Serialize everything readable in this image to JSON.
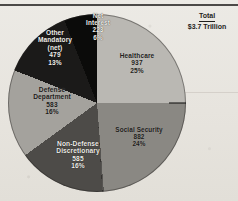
{
  "figure": {
    "total_label": "Total",
    "total_value": "$3.7 Trillion"
  },
  "chart_data": {
    "type": "pie",
    "title": "",
    "subtitle": "",
    "units": "billions of dollars",
    "total": "$3.7 Trillion",
    "legend_position": "none (labels inside slices)",
    "grid": false,
    "categories": [
      "Healthcare",
      "Social Security",
      "Non-Defense Discretionary",
      "Defense Department",
      "Other Mandatory (net)",
      "Net Interest"
    ],
    "values": [
      937,
      882,
      585,
      583,
      479,
      223
    ],
    "percentages": [
      25,
      24,
      16,
      16,
      13,
      6
    ],
    "slices": [
      {
        "name": "Healthcare",
        "label_lines": [
          "Healthcare",
          "937",
          "25%"
        ],
        "value": 937,
        "percent": "25%",
        "color": "#b9b7b2",
        "text_color": "dark"
      },
      {
        "name": "Social Security",
        "label_lines": [
          "Social Security",
          "882",
          "24%"
        ],
        "value": 882,
        "percent": "24%",
        "color": "#8a8883",
        "text_color": "dark"
      },
      {
        "name": "Non-Defense Discretionary",
        "label_lines": [
          "Non-Defense",
          "Discretionary",
          "585",
          "16%"
        ],
        "value": 585,
        "percent": "16%",
        "color": "#4e4c49",
        "text_color": "light"
      },
      {
        "name": "Defense Department",
        "label_lines": [
          "Defense",
          "Department",
          "583",
          "16%"
        ],
        "value": 583,
        "percent": "16%",
        "color": "#a3a19c",
        "text_color": "dark"
      },
      {
        "name": "Other Mandatory (net)",
        "label_lines": [
          "Other",
          "Mandatory",
          "(net)",
          "479",
          "13%"
        ],
        "value": 479,
        "percent": "13%",
        "color": "#1d1c1b",
        "text_color": "light"
      },
      {
        "name": "Net Interest",
        "label_lines": [
          "Net",
          "Interest",
          "223",
          "6%"
        ],
        "value": 223,
        "percent": "6%",
        "color": "#0d0d0c",
        "text_color": "light"
      }
    ]
  }
}
